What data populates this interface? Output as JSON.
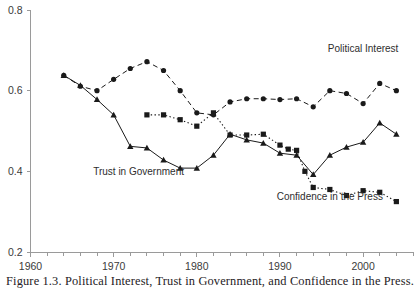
{
  "figure": {
    "caption": "Figure 1.3. Political Interest, Trust in Government, and Confidence in the Press.",
    "width": 420,
    "height": 297
  },
  "chart_data": {
    "type": "line",
    "title": "",
    "xlabel": "",
    "ylabel": "",
    "xlim": [
      1960,
      2006
    ],
    "ylim": [
      0.2,
      0.8
    ],
    "y_ticks": [
      0.2,
      0.4,
      0.6,
      0.8
    ],
    "y_tick_labels": [
      "0.2",
      "0.4",
      "0.6",
      "0.8"
    ],
    "x_ticks": [
      1960,
      1962,
      1964,
      1966,
      1968,
      1970,
      1972,
      1974,
      1976,
      1978,
      1980,
      1982,
      1984,
      1986,
      1988,
      1990,
      1992,
      1994,
      1996,
      1998,
      2000,
      2002,
      2004,
      2006
    ],
    "x_tick_labels_major": [
      "1960",
      "1970",
      "1980",
      "1990",
      "2000"
    ],
    "x_ticks_major": [
      1960,
      1970,
      1980,
      1990,
      2000
    ],
    "x_minor_tick_interval": 2,
    "grid": false,
    "legend_position": "inline-annotations",
    "series": [
      {
        "name": "Political Interest",
        "marker": "circle",
        "linestyle": "dashed",
        "color": "#1a1a1a",
        "label_x": 2000,
        "label_y": 0.695,
        "x": [
          1964,
          1966,
          1968,
          1970,
          1972,
          1974,
          1976,
          1978,
          1980,
          1982,
          1984,
          1986,
          1988,
          1990,
          1992,
          1994,
          1996,
          1998,
          2000,
          2002,
          2004
        ],
        "y": [
          0.638,
          0.611,
          0.6,
          0.628,
          0.655,
          0.672,
          0.65,
          0.6,
          0.545,
          0.54,
          0.572,
          0.58,
          0.58,
          0.578,
          0.58,
          0.56,
          0.6,
          0.593,
          0.568,
          0.618,
          0.6
        ]
      },
      {
        "name": "Trust in Government",
        "marker": "triangle",
        "linestyle": "solid",
        "color": "#1a1a1a",
        "label_x": 1973,
        "label_y": 0.392,
        "x": [
          1964,
          1966,
          1968,
          1970,
          1972,
          1974,
          1976,
          1978,
          1980,
          1982,
          1984,
          1986,
          1988,
          1990,
          1992,
          1994,
          1996,
          1998,
          2000,
          2002,
          2004
        ],
        "y": [
          0.638,
          0.613,
          0.578,
          0.54,
          0.462,
          0.458,
          0.428,
          0.408,
          0.408,
          0.44,
          0.492,
          0.478,
          0.47,
          0.445,
          0.44,
          0.392,
          0.44,
          0.46,
          0.472,
          0.52,
          0.492
        ]
      },
      {
        "name": "Confidence in the Press",
        "marker": "square",
        "linestyle": "dotted",
        "color": "#1a1a1a",
        "label_x": 1996,
        "label_y": 0.33,
        "x": [
          1974,
          1976,
          1978,
          1980,
          1982,
          1984,
          1986,
          1988,
          1990,
          1991,
          1992,
          1993,
          1994,
          1996,
          1998,
          2000,
          2002,
          2004
        ],
        "y": [
          0.54,
          0.54,
          0.528,
          0.512,
          0.545,
          0.49,
          0.49,
          0.492,
          0.465,
          0.455,
          0.452,
          0.4,
          0.36,
          0.355,
          0.34,
          0.352,
          0.348,
          0.325
        ]
      }
    ],
    "annotations": [
      {
        "text": "Political Interest",
        "series": "Political Interest"
      },
      {
        "text": "Trust in Government",
        "series": "Trust in Government"
      },
      {
        "text": "Confidence in the Press",
        "series": "Confidence in the Press"
      }
    ]
  }
}
